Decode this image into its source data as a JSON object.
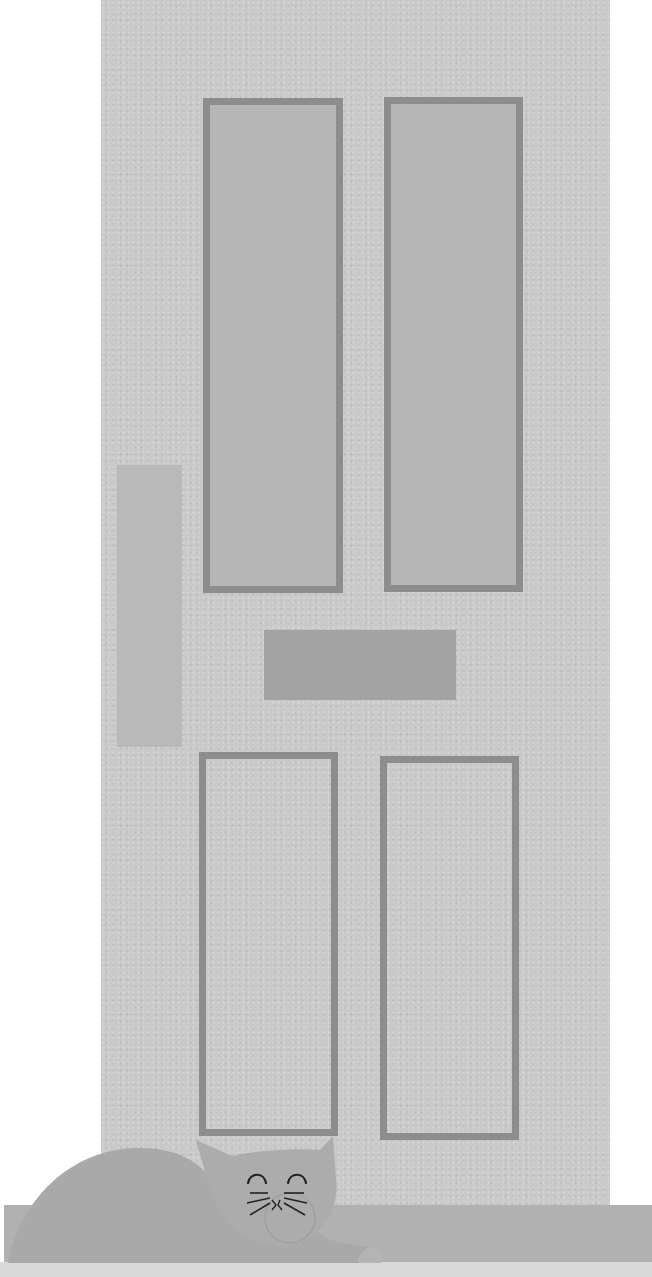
{
  "scene": {
    "description": "Illustration of a paneled front door with a sleeping cat on the doorstep",
    "colors": {
      "background": "#ffffff",
      "door": "#c9c9c9",
      "panel_border": "#8d8d8d",
      "upper_panel_fill": "#b6b6b6",
      "letterbox": "#a3a3a3",
      "handle_plate": "#b9b9b9",
      "step": "#b1b1b1",
      "floor": "#d9d9d9",
      "cat": "#a9a9a9",
      "cat_features": "#222222"
    },
    "door": {
      "panels": [
        {
          "id": "upper-left",
          "type": "glass"
        },
        {
          "id": "upper-right",
          "type": "glass"
        },
        {
          "id": "lower-left",
          "type": "raised"
        },
        {
          "id": "lower-right",
          "type": "raised"
        }
      ],
      "letterbox": "mail-slot",
      "handle_plate": "push-plate"
    },
    "cat": {
      "pose": "lying",
      "eyes": "closed",
      "icon": "sleeping-cat-icon"
    }
  }
}
